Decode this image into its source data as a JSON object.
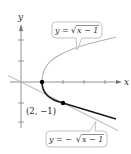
{
  "figure": {
    "axes": {
      "x_label": "x",
      "y_label": "y"
    },
    "curves": [
      {
        "name": "upper-half",
        "label": "y = √x − 1",
        "color": "#b3b3b3"
      },
      {
        "name": "lower-half",
        "label": "y = −√x − 1",
        "color": "#1a1a1a"
      }
    ],
    "tangent_line": {
      "color": "#b3b3b3"
    },
    "points": [
      {
        "label": "",
        "x": 1,
        "y": 0
      },
      {
        "label": "(2, −1)",
        "x": 2,
        "y": -1
      }
    ],
    "callouts": {
      "upper_text_left": "y = ",
      "upper_text_rad": "x − 1",
      "lower_text_left": "y = −",
      "lower_text_rad": "x − 1"
    }
  }
}
